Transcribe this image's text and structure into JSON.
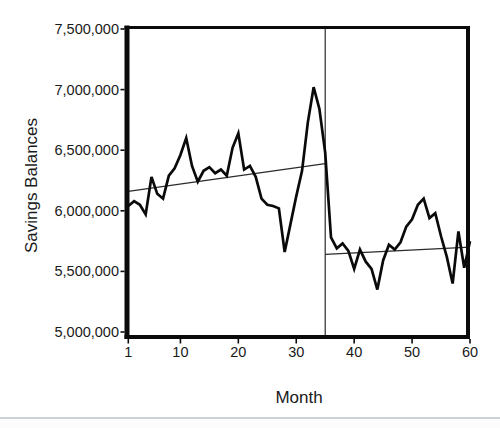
{
  "chart_data": {
    "type": "line",
    "title": "",
    "xlabel": "Month",
    "ylabel": "Savings Balances",
    "xlim": [
      1,
      60
    ],
    "ylim": [
      5000000,
      7500000
    ],
    "grid": false,
    "legend": "none",
    "x_tick_values": [
      1,
      10,
      20,
      30,
      40,
      50,
      60
    ],
    "x_tick_labels": [
      "1",
      "10",
      "20",
      "30",
      "40",
      "50",
      "60"
    ],
    "y_tick_values": [
      5000000,
      5500000,
      6000000,
      6500000,
      7000000,
      7500000
    ],
    "y_tick_labels": [
      "5,000,000",
      "5,500,000",
      "6,000,000",
      "6,500,000",
      "7,000,000",
      "7,500,000"
    ],
    "months": [
      1,
      2,
      3,
      4,
      5,
      6,
      7,
      8,
      9,
      10,
      11,
      12,
      13,
      14,
      15,
      16,
      17,
      18,
      19,
      20,
      21,
      22,
      23,
      24,
      25,
      26,
      27,
      28,
      29,
      30,
      31,
      32,
      33,
      34,
      35,
      36,
      37,
      38,
      39,
      40,
      41,
      42,
      43,
      44,
      45,
      46,
      47,
      48,
      49,
      50,
      51,
      52,
      53,
      54,
      55,
      56,
      57,
      58,
      59,
      60
    ],
    "series": [
      {
        "name": "Savings Balances",
        "values": [
          6040000,
          6080000,
          6050000,
          5970000,
          6280000,
          6140000,
          6100000,
          6290000,
          6350000,
          6460000,
          6600000,
          6370000,
          6240000,
          6330000,
          6360000,
          6310000,
          6340000,
          6290000,
          6520000,
          6640000,
          6340000,
          6370000,
          6280000,
          6100000,
          6050000,
          6040000,
          6020000,
          5660000,
          5890000,
          6120000,
          6330000,
          6730000,
          7020000,
          6840000,
          6480000,
          5780000,
          5690000,
          5730000,
          5670000,
          5520000,
          5680000,
          5580000,
          5520000,
          5350000,
          5590000,
          5720000,
          5680000,
          5740000,
          5870000,
          5930000,
          6050000,
          6100000,
          5940000,
          5980000,
          5790000,
          5620000,
          5400000,
          5830000,
          5530000,
          5750000
        ]
      }
    ],
    "annotations": {
      "vertical_reference_line": {
        "month": 35
      },
      "pre_intervention_trend": {
        "from_month": 1,
        "from_value": 6160000,
        "to_month": 35,
        "to_value": 6390000
      },
      "post_intervention_trend": {
        "from_month": 35,
        "from_value": 5640000,
        "to_month": 60,
        "to_value": 5700000
      }
    },
    "colors": {
      "series": "#0a0a0a",
      "reference_lines": "#2b2b2b",
      "frame": "#0b0b0b",
      "text": "#1a1a1a"
    }
  }
}
